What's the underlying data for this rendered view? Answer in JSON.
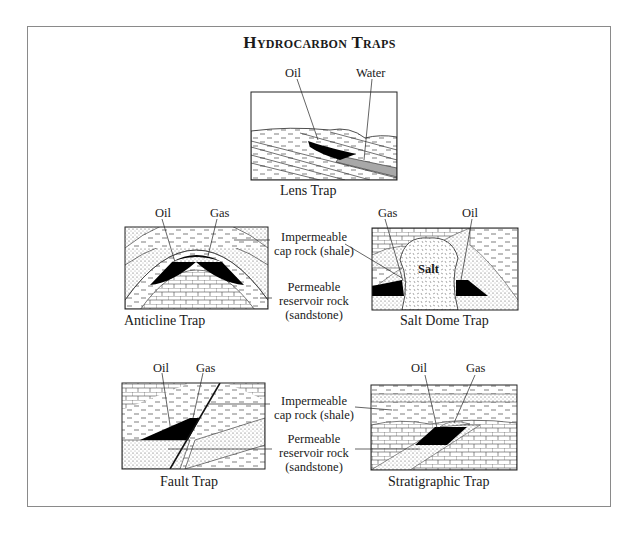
{
  "title": "Hydrocarbon Traps",
  "legend_labels": {
    "cap_rock": [
      "Impermeable",
      "cap rock (shale)"
    ],
    "reservoir_rock": [
      "Permeable",
      "reservoir rock",
      "(sandstone)"
    ]
  },
  "diagrams": {
    "lens": {
      "caption": "Lens Trap",
      "labels": {
        "oil": "Oil",
        "water": "Water"
      }
    },
    "anticline": {
      "caption": "Anticline Trap",
      "labels": {
        "oil": "Oil",
        "gas": "Gas"
      }
    },
    "salt_dome": {
      "caption": "Salt Dome Trap",
      "labels": {
        "gas": "Gas",
        "oil": "Oil",
        "salt": "Salt"
      }
    },
    "fault": {
      "caption": "Fault Trap",
      "labels": {
        "oil": "Oil",
        "gas": "Gas"
      }
    },
    "stratigraphic": {
      "caption": "Stratigraphic Trap",
      "labels": {
        "oil": "Oil",
        "gas": "Gas"
      }
    }
  },
  "colors": {
    "oil": "#000000",
    "water": "#a8a8a8",
    "line": "#1a1a1a",
    "frame": "#8a8a8a"
  }
}
